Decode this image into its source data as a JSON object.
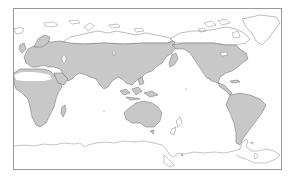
{
  "map": {
    "title": "Distribution range map",
    "projection": "Pacific-centered world map",
    "colors": {
      "range_fill": "#c8c8c8",
      "land_outline_fill": "#ffffff",
      "coastline_stroke": "#6a6a6a",
      "frame_border": "#9a9a9a",
      "background": "#ffffff"
    },
    "shaded_regions": [
      "Europe",
      "Africa (excluding Sahara)",
      "Asia",
      "Arabian Peninsula",
      "Indian Subcontinent",
      "Southeast Asia",
      "Australia",
      "North America (south of Arctic)",
      "Central America",
      "South America"
    ],
    "unshaded_regions": [
      "Sahara Desert",
      "Greenland",
      "Arctic Archipelago",
      "Arctic Siberia",
      "Antarctica",
      "New Zealand"
    ]
  }
}
